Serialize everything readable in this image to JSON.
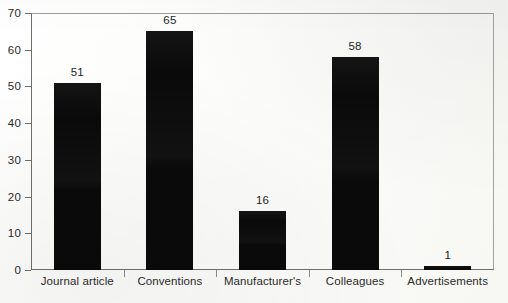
{
  "chart_data": {
    "type": "bar",
    "title": "",
    "subtitle": "",
    "xlabel": "",
    "ylabel": "",
    "categories": [
      "Journal article",
      "Conventions",
      "Manufacturer's",
      "Colleagues",
      "Advertisements"
    ],
    "values": [
      51,
      65,
      16,
      58,
      1
    ],
    "value_labels": [
      "51",
      "65",
      "16",
      "58",
      "1"
    ],
    "ylim": [
      0,
      70
    ],
    "ytick_values": [
      0,
      10,
      20,
      30,
      40,
      50,
      60,
      70
    ],
    "ytick_labels": [
      "0",
      "10",
      "20",
      "30",
      "40",
      "50",
      "60",
      "70"
    ],
    "grid": false,
    "legend": null,
    "bar_color": "#0a0a0a",
    "axis_color": "#6f6f6d",
    "background_color": "#fdfdfb"
  }
}
